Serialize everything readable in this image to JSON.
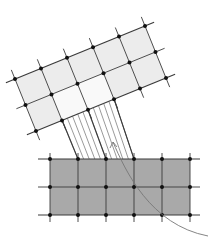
{
  "diagram": {
    "colors": {
      "background": "#ffffff",
      "upper_fill": "#ececec",
      "upper_highlight_fill": "#f9f9f9",
      "lower_fill": "#a9a9a9",
      "grid_line": "#3a3a3a",
      "node": "#111111",
      "projection_line": "#555555",
      "curve": "#777777"
    },
    "upper_grid": {
      "origin": [
        15,
        79
      ],
      "col_vector": [
        26,
        -10.6
      ],
      "row_vector": [
        10.5,
        26
      ],
      "cols": 5,
      "rows": 2,
      "highlight_cells": [
        [
          1,
          1
        ],
        [
          1,
          2
        ]
      ]
    },
    "lower_grid": {
      "origin": [
        50,
        159
      ],
      "cell": 28,
      "cols": 5,
      "rows": 2
    },
    "projection": {
      "from_segment": [
        [
          62,
          120
        ],
        [
          114,
          99
        ]
      ],
      "to_segment": [
        [
          78,
          159
        ],
        [
          134,
          159
        ]
      ],
      "line_count": 10,
      "bold_pairs": [
        [
          [
            62,
            120
          ],
          [
            78,
            159
          ]
        ],
        [
          [
            88,
            110
          ],
          [
            106,
            159
          ]
        ],
        [
          [
            114,
            99
          ],
          [
            134,
            159
          ]
        ]
      ]
    },
    "curve": {
      "start": [
        113,
        142
      ],
      "control1": [
        125,
        170
      ],
      "control2": [
        150,
        225
      ],
      "end": [
        208,
        236
      ]
    }
  }
}
